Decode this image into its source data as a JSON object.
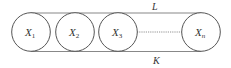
{
  "diagram": {
    "nodes": [
      {
        "label": "X",
        "sub": "1"
      },
      {
        "label": "X",
        "sub": "2"
      },
      {
        "label": "X",
        "sub": "3"
      },
      {
        "label": "X",
        "sub": "n"
      }
    ],
    "top_label": "L",
    "bottom_label": "K",
    "colors": {
      "stroke": "#555555",
      "band": "#888888",
      "text": "#333333"
    }
  }
}
